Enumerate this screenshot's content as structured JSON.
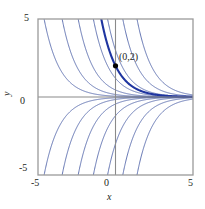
{
  "figure": {
    "background": "#ffffff",
    "frame_color": "#9a9a9a",
    "axis_color": "#808080",
    "curve_color": "#4a5fa5",
    "highlight_color": "#1f35a0",
    "marker_color": "#000000"
  },
  "axes": {
    "x_label": "x",
    "y_label": "y",
    "x_ticks": [
      "-5",
      "0",
      "5"
    ],
    "y_ticks": [
      "5",
      "0",
      "-5"
    ],
    "y_tick_top": "5",
    "y_tick_mid": "0",
    "y_tick_bottom": "-5",
    "x_tick_left": "-5",
    "x_tick_mid": "0",
    "x_tick_right": "5"
  },
  "annotations": {
    "point_label": "(0,2)"
  },
  "chart_data": {
    "type": "line",
    "title": "",
    "xlabel": "x",
    "ylabel": "y",
    "xlim": [
      -5,
      5
    ],
    "ylim": [
      -5,
      5
    ],
    "grid": false,
    "legend": "none",
    "family_formula": "y = C*e^(-x)",
    "constants": [
      -20,
      -8,
      -3,
      -1.2,
      -0.45,
      -0.16,
      -0.05,
      0.05,
      0.16,
      0.45,
      1.2,
      3,
      8,
      20
    ],
    "highlight": {
      "constant": 2,
      "formula": "y = 2*e^(-x)",
      "marker_point": [
        0,
        2
      ],
      "marker_label": "(0,2)"
    },
    "series": [
      {
        "name": "C=-20",
        "C": -20
      },
      {
        "name": "C=-8",
        "C": -8
      },
      {
        "name": "C=-3",
        "C": -3
      },
      {
        "name": "C=-1.2",
        "C": -1.2
      },
      {
        "name": "C=-0.45",
        "C": -0.45
      },
      {
        "name": "C=-0.16",
        "C": -0.16
      },
      {
        "name": "C=-0.05",
        "C": -0.05
      },
      {
        "name": "C=0.05",
        "C": 0.05
      },
      {
        "name": "C=0.16",
        "C": 0.16
      },
      {
        "name": "C=0.45",
        "C": 0.45
      },
      {
        "name": "C=1.2",
        "C": 1.2
      },
      {
        "name": "C=2",
        "C": 2
      },
      {
        "name": "C=3",
        "C": 3
      },
      {
        "name": "C=8",
        "C": 8
      },
      {
        "name": "C=20",
        "C": 20
      }
    ]
  }
}
